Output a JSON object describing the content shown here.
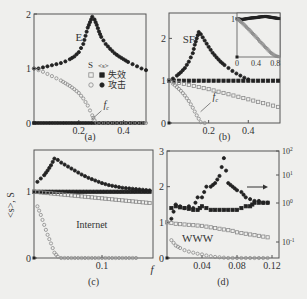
{
  "figure": {
    "background": "#efefed",
    "axis_color": "#555555",
    "filled_color": "#222222",
    "open_color": "#8a8a8a",
    "shared_xlabel": "f",
    "shared_ylabel": "<s>, S"
  },
  "chart_data": [
    {
      "id": "a",
      "type": "scatter",
      "caption": "(a)",
      "title": "",
      "xlabel": "f",
      "ylabel": "<s>, S",
      "xlim": [
        0,
        0.5
      ],
      "ylim": [
        0,
        2
      ],
      "xticks": [
        0.2,
        0.4
      ],
      "yticks": [
        0,
        1,
        2
      ],
      "annotations": [
        {
          "text": "E",
          "x": 0.2,
          "y": 1.5
        },
        {
          "text": "f_c",
          "x": 0.31,
          "y": 0.28
        }
      ],
      "legend": {
        "header": [
          "S",
          "<s>"
        ],
        "rows": [
          {
            "label": "失效",
            "meaning": "failure",
            "S_marker": "open-square",
            "s_marker": "filled-square"
          },
          {
            "label": "攻击",
            "meaning": "attack",
            "S_marker": "open-circle",
            "s_marker": "filled-circle"
          }
        ]
      },
      "series": [
        {
          "name": "<s> failure",
          "marker": "filled-square",
          "x": [
            0,
            0.5
          ],
          "y": [
            0,
            0
          ],
          "note": "flat near 0"
        },
        {
          "name": "<s> attack",
          "marker": "filled-circle",
          "x": [
            0.0,
            0.02,
            0.04,
            0.06,
            0.08,
            0.1,
            0.12,
            0.14,
            0.16,
            0.18,
            0.2,
            0.22,
            0.23,
            0.24,
            0.25,
            0.26,
            0.27,
            0.28,
            0.29,
            0.3,
            0.32,
            0.34,
            0.36,
            0.38,
            0.4,
            0.42,
            0.44,
            0.46,
            0.48,
            0.5
          ],
          "y": [
            1.0,
            1.0,
            1.02,
            1.04,
            1.06,
            1.08,
            1.1,
            1.13,
            1.17,
            1.22,
            1.3,
            1.45,
            1.6,
            1.75,
            1.85,
            1.95,
            1.9,
            1.8,
            1.68,
            1.58,
            1.45,
            1.36,
            1.28,
            1.22,
            1.17,
            1.12,
            1.08,
            1.04,
            1.0,
            0.97
          ]
        },
        {
          "name": "S attack",
          "marker": "open-circle",
          "x": [
            0.0,
            0.02,
            0.04,
            0.06,
            0.08,
            0.1,
            0.12,
            0.14,
            0.16,
            0.18,
            0.2,
            0.22,
            0.24,
            0.26,
            0.27,
            0.28,
            0.3,
            0.34,
            0.38,
            0.42,
            0.46,
            0.5
          ],
          "y": [
            1.0,
            0.97,
            0.94,
            0.9,
            0.86,
            0.82,
            0.78,
            0.73,
            0.68,
            0.62,
            0.55,
            0.45,
            0.32,
            0.14,
            0.05,
            0.0,
            0.0,
            0.0,
            0.0,
            0.0,
            0.0,
            0.0
          ]
        }
      ]
    },
    {
      "id": "b",
      "type": "scatter",
      "caption": "(b)",
      "xlabel": "f",
      "ylabel": "<s>, S",
      "xlim": [
        0,
        0.56
      ],
      "ylim": [
        0,
        2.6
      ],
      "xticks": [
        0.2,
        0.4
      ],
      "yticks": [
        0,
        1,
        2
      ],
      "annotations": [
        {
          "text": "SF",
          "x": 0.1,
          "y": 1.9
        },
        {
          "text": "f_c",
          "x": 0.22,
          "y": 0.55
        }
      ],
      "series": [
        {
          "name": "<s> failure",
          "marker": "filled-square",
          "x": [
            0,
            0.05,
            0.1,
            0.15,
            0.2,
            0.25,
            0.3,
            0.35,
            0.4,
            0.45,
            0.5,
            0.55
          ],
          "y": [
            1,
            1,
            1,
            1,
            1,
            1,
            1,
            1,
            1,
            1,
            1,
            1
          ]
        },
        {
          "name": "S failure",
          "marker": "open-square",
          "x": [
            0,
            0.05,
            0.1,
            0.15,
            0.2,
            0.25,
            0.3,
            0.35,
            0.4,
            0.45,
            0.5,
            0.55
          ],
          "y": [
            1.0,
            0.95,
            0.9,
            0.85,
            0.8,
            0.74,
            0.68,
            0.62,
            0.56,
            0.5,
            0.44,
            0.38
          ]
        },
        {
          "name": "<s> attack",
          "marker": "filled-circle",
          "x": [
            0.0,
            0.02,
            0.04,
            0.06,
            0.08,
            0.1,
            0.12,
            0.13,
            0.14,
            0.15,
            0.16,
            0.18,
            0.2,
            0.22,
            0.24,
            0.26,
            0.28,
            0.3,
            0.32,
            0.34,
            0.36,
            0.38,
            0.4
          ],
          "y": [
            1.0,
            1.05,
            1.12,
            1.2,
            1.3,
            1.45,
            1.65,
            1.85,
            2.0,
            2.15,
            2.1,
            1.95,
            1.8,
            1.66,
            1.55,
            1.45,
            1.37,
            1.3,
            1.23,
            1.17,
            1.12,
            1.07,
            1.03
          ]
        },
        {
          "name": "S attack",
          "marker": "open-circle",
          "x": [
            0.0,
            0.02,
            0.04,
            0.06,
            0.08,
            0.1,
            0.12,
            0.14,
            0.16,
            0.18
          ],
          "y": [
            1.0,
            0.93,
            0.85,
            0.76,
            0.65,
            0.52,
            0.36,
            0.18,
            0.02,
            0.0
          ]
        }
      ],
      "inset": {
        "xlim": [
          0,
          0.9
        ],
        "ylim": [
          0,
          1.15
        ],
        "xticks": [
          0,
          0.4,
          0.8
        ],
        "yticks": [
          1
        ],
        "series": [
          {
            "name": "<s> failure",
            "marker": "filled-square",
            "x": [
              0,
              0.1,
              0.2,
              0.3,
              0.4,
              0.5,
              0.6,
              0.7,
              0.8,
              0.9
            ],
            "y": [
              1,
              0.98,
              1.0,
              1.02,
              1.03,
              1.05,
              1.06,
              1.04,
              1.02,
              1.0
            ]
          },
          {
            "name": "S failure",
            "marker": "open-square",
            "x": [
              0,
              0.1,
              0.2,
              0.3,
              0.4,
              0.5,
              0.6,
              0.7,
              0.8,
              0.9
            ],
            "y": [
              1.0,
              0.9,
              0.78,
              0.65,
              0.52,
              0.38,
              0.25,
              0.12,
              0.03,
              0.0
            ]
          }
        ]
      }
    },
    {
      "id": "c",
      "type": "scatter",
      "caption": "(c)",
      "xlabel": "f",
      "ylabel": "<s>, S",
      "xlim": [
        0,
        0.175
      ],
      "ylim": [
        0,
        1.63
      ],
      "xticks": [
        0.1
      ],
      "yticks": [
        0,
        1
      ],
      "annotations": [
        {
          "text": "Internet",
          "x": 0.085,
          "y": 0.45
        }
      ],
      "series": [
        {
          "name": "<s> failure",
          "marker": "filled-square",
          "x": [
            0,
            0.01,
            0.02,
            0.03,
            0.04,
            0.05,
            0.06,
            0.07,
            0.08,
            0.09,
            0.1,
            0.11,
            0.12,
            0.13,
            0.14,
            0.15,
            0.16,
            0.17
          ],
          "y": [
            1,
            1,
            1,
            1,
            1,
            1,
            1,
            1,
            1,
            1,
            1,
            1,
            1,
            1,
            1,
            1,
            1,
            1
          ]
        },
        {
          "name": "S failure",
          "marker": "open-square",
          "x": [
            0,
            0.01,
            0.02,
            0.03,
            0.04,
            0.05,
            0.06,
            0.07,
            0.08,
            0.09,
            0.1,
            0.11,
            0.12,
            0.13,
            0.14,
            0.15,
            0.16,
            0.17
          ],
          "y": [
            1.0,
            0.99,
            0.98,
            0.97,
            0.96,
            0.95,
            0.94,
            0.93,
            0.92,
            0.91,
            0.9,
            0.89,
            0.88,
            0.87,
            0.86,
            0.85,
            0.84,
            0.83
          ]
        },
        {
          "name": "<s> attack",
          "marker": "filled-circle",
          "x": [
            0.005,
            0.01,
            0.015,
            0.02,
            0.025,
            0.03,
            0.035,
            0.04,
            0.05,
            0.06,
            0.07,
            0.08,
            0.09,
            0.1,
            0.11,
            0.12,
            0.13,
            0.14,
            0.15,
            0.16,
            0.17
          ],
          "y": [
            1.15,
            1.2,
            1.25,
            1.32,
            1.4,
            1.5,
            1.48,
            1.44,
            1.38,
            1.32,
            1.26,
            1.21,
            1.17,
            1.13,
            1.1,
            1.08,
            1.06,
            1.05,
            1.04,
            1.03,
            1.02
          ]
        },
        {
          "name": "S attack",
          "marker": "open-circle",
          "x": [
            0.005,
            0.01,
            0.015,
            0.02,
            0.025,
            0.03,
            0.035,
            0.04,
            0.05,
            0.06,
            0.07,
            0.08,
            0.09,
            0.1,
            0.11,
            0.12,
            0.13,
            0.14,
            0.15
          ],
          "y": [
            0.78,
            0.65,
            0.5,
            0.35,
            0.22,
            0.08,
            0.02,
            0.0,
            0.0,
            0.0,
            0.0,
            0.0,
            0.0,
            0.0,
            0.0,
            0.0,
            0.0,
            0.0,
            0.0
          ]
        }
      ]
    },
    {
      "id": "d",
      "type": "scatter",
      "caption": "(d)",
      "xlabel": "f",
      "ylabel": "<s>, S",
      "xlim": [
        0,
        0.128
      ],
      "ylim": [
        0,
        3
      ],
      "xticks": [
        0.04,
        0.08,
        0.12
      ],
      "yticks": [
        0,
        1,
        2,
        3
      ],
      "right_axis": {
        "scale": "log",
        "ticks": [
          "10^-1",
          "10^0",
          "10^1",
          "10^2"
        ],
        "arrow_label": "→",
        "arrow_target": "right axis"
      },
      "annotations": [
        {
          "text": "WWW",
          "x": 0.035,
          "y": 0.45
        }
      ],
      "series": [
        {
          "name": "<s> failure",
          "marker": "filled-square",
          "x": [
            0.005,
            0.01,
            0.015,
            0.02,
            0.025,
            0.03,
            0.035,
            0.04,
            0.045,
            0.05,
            0.055,
            0.06,
            0.065,
            0.07,
            0.075,
            0.08,
            0.085,
            0.09,
            0.095,
            0.1,
            0.105,
            0.11,
            0.115
          ],
          "y": [
            1.4,
            1.45,
            1.42,
            1.4,
            1.38,
            1.35,
            1.35,
            1.45,
            1.4,
            1.35,
            1.35,
            1.35,
            1.35,
            1.35,
            1.35,
            1.35,
            1.4,
            1.45,
            1.45,
            1.55,
            1.55,
            1.55,
            1.55
          ]
        },
        {
          "name": "S failure",
          "marker": "open-square",
          "x": [
            0,
            0.005,
            0.01,
            0.015,
            0.02,
            0.025,
            0.03,
            0.035,
            0.04,
            0.045,
            0.05,
            0.055,
            0.06,
            0.065,
            0.07,
            0.075,
            0.08,
            0.085,
            0.09,
            0.095,
            0.1,
            0.105,
            0.11,
            0.115
          ],
          "y": [
            1.0,
            0.98,
            0.96,
            0.95,
            0.94,
            0.93,
            0.92,
            0.91,
            0.9,
            0.88,
            0.86,
            0.84,
            0.82,
            0.8,
            0.78,
            0.76,
            0.72,
            0.7,
            0.68,
            0.66,
            0.64,
            0.62,
            0.6,
            0.58
          ]
        },
        {
          "name": "<s> attack (right log axis)",
          "marker": "filled-circle",
          "x": [
            0.005,
            0.01,
            0.015,
            0.02,
            0.025,
            0.03,
            0.035,
            0.04,
            0.045,
            0.05,
            0.055,
            0.06,
            0.065,
            0.07,
            0.075,
            0.08,
            0.085,
            0.09,
            0.095,
            0.1,
            0.105,
            0.11,
            0.115
          ],
          "y": [
            1.1,
            1.5,
            1.45,
            1.4,
            1.45,
            1.4,
            1.7,
            1.7,
            2.0,
            2.0,
            2.1,
            2.3,
            2.8,
            2.1,
            2.0,
            1.9,
            1.85,
            1.7,
            1.65,
            1.6,
            1.6,
            1.55,
            1.55
          ]
        },
        {
          "name": "S attack",
          "marker": "open-circle",
          "x": [
            0.005,
            0.01,
            0.015,
            0.02,
            0.025,
            0.03,
            0.035,
            0.04,
            0.045,
            0.05,
            0.055,
            0.06,
            0.07,
            0.08,
            0.09,
            0.1,
            0.11,
            0.115
          ],
          "y": [
            0.5,
            0.35,
            0.28,
            0.22,
            0.18,
            0.15,
            0.12,
            0.1,
            0.07,
            0.05,
            0.03,
            0.02,
            0.0,
            0.0,
            0.0,
            0.0,
            0.0,
            0.0
          ]
        }
      ]
    }
  ],
  "layout": {
    "panels": {
      "a": {
        "x0": 34,
        "x1": 146,
        "y0": 14,
        "y1": 123,
        "caption_y": 140
      },
      "b": {
        "x0": 169,
        "x1": 280,
        "y0": 13,
        "y1": 123,
        "caption_y": 140,
        "inset": {
          "x0": 237,
          "x1": 280,
          "y0": 13,
          "y1": 57
        }
      },
      "c": {
        "x0": 34,
        "x1": 153,
        "y0": 150,
        "y1": 258,
        "caption_y": 285
      },
      "d": {
        "x0": 167,
        "x1": 279,
        "y0": 151,
        "y1": 258,
        "caption_y": 285
      }
    }
  }
}
